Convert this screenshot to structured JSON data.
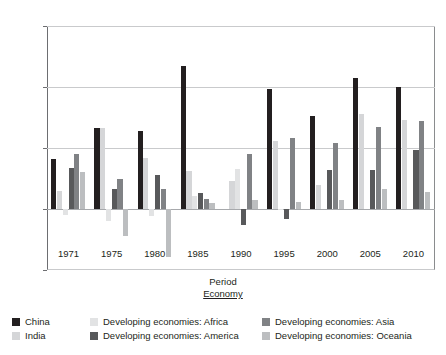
{
  "chart_data": {
    "type": "bar",
    "title": "",
    "xlabel": "Period",
    "ylabel": "",
    "ylim": [
      -5,
      15
    ],
    "yticks": [
      -5,
      0,
      5,
      10,
      15
    ],
    "grid": true,
    "legend_position": "bottom",
    "legend_title": "Economy",
    "categories": [
      "1971",
      "1975",
      "1980",
      "1985",
      "1990",
      "1995",
      "2000",
      "2005",
      "2010"
    ],
    "series": [
      {
        "name": "China",
        "color": "#231f20",
        "values": [
          4.1,
          6.6,
          6.4,
          11.7,
          0.0,
          9.8,
          7.6,
          10.7,
          10.0
        ]
      },
      {
        "name": "India",
        "color": "#d5d6d8",
        "values": [
          1.5,
          6.6,
          4.2,
          3.1,
          2.3,
          5.6,
          2.0,
          7.8,
          7.3
        ]
      },
      {
        "name": "Developing economies: Africa",
        "color": "#e2e3e4",
        "values": [
          -0.5,
          -1.0,
          -0.6,
          1.1,
          3.3,
          -0.1,
          0.0,
          0.0,
          0.0
        ]
      },
      {
        "name": "Developing economies: America",
        "color": "#58595b",
        "values": [
          3.4,
          1.6,
          2.8,
          1.3,
          -1.3,
          -0.8,
          3.2,
          3.2,
          4.8
        ]
      },
      {
        "name": "Developing economies: Asia",
        "color": "#808285",
        "values": [
          4.5,
          2.5,
          1.6,
          0.8,
          4.5,
          5.8,
          5.4,
          6.7,
          7.2
        ]
      },
      {
        "name": "Developing economies: Oceania",
        "color": "#bcbec0",
        "values": [
          3.0,
          -2.2,
          -3.9,
          0.5,
          0.7,
          0.6,
          0.7,
          1.6,
          1.4
        ]
      }
    ]
  },
  "axis": {
    "x_title": "Period",
    "y_tick_labels": [
      "15",
      "10",
      "5",
      "0",
      "-5"
    ],
    "x_tick_labels": [
      "1971",
      "1975",
      "1980",
      "1985",
      "1990",
      "1995",
      "2000",
      "2005",
      "2010"
    ]
  },
  "legend": {
    "title": "Economy",
    "columns": [
      {
        "items": [
          {
            "label": "China",
            "color": "#231f20"
          },
          {
            "label": "India",
            "color": "#d5d6d8"
          }
        ]
      },
      {
        "items": [
          {
            "label": "Developing economies: Africa",
            "color": "#e2e3e4"
          },
          {
            "label": "Developing economies: America",
            "color": "#58595b"
          }
        ]
      },
      {
        "items": [
          {
            "label": "Developing economies: Asia",
            "color": "#808285"
          },
          {
            "label": "Developing economies: Oceania",
            "color": "#bcbec0"
          }
        ]
      }
    ]
  }
}
